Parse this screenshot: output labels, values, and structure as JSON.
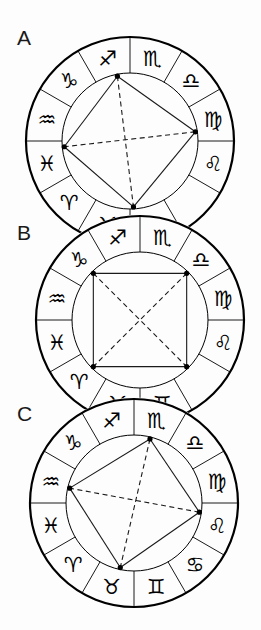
{
  "figure": {
    "type": "astrological-aspect-pattern-diagram",
    "panel_count": 3,
    "canvas": {
      "width": 261,
      "height": 630
    },
    "background_color": "#fdfdfd",
    "stroke_color": "#000000",
    "line_color": "#1a1a1a"
  },
  "zodiac": {
    "order_counterclockwise_from_top_right": [
      "Sagittarius",
      "Capricorn",
      "Aquarius",
      "Pisces",
      "Aries",
      "Taurus",
      "Gemini",
      "Cancer",
      "Leo",
      "Virgo",
      "Libra",
      "Scorpio"
    ],
    "glyphs": {
      "Aries": "♈",
      "Taurus": "♉",
      "Gemini": "♊",
      "Cancer": "♋",
      "Leo": "♌",
      "Virgo": "♍",
      "Libra": "♎",
      "Scorpio": "♏",
      "Sagittarius": "♐",
      "Capricorn": "♑",
      "Aquarius": "♒",
      "Pisces": "♓"
    },
    "sector_count": 12,
    "sector_span_degrees": 30
  },
  "panels": [
    {
      "id": "A",
      "label": "A",
      "label_position": {
        "x": 17,
        "y": 27
      },
      "center": {
        "x": 130,
        "y": 141
      },
      "outer_radius": 104,
      "inner_radius": 68,
      "visible_signs": [
        "Sagittarius",
        "Capricorn",
        "Aquarius",
        "Pisces",
        "Aries",
        "Taurus",
        "Leo",
        "Virgo",
        "Libra",
        "Scorpio"
      ],
      "clipped_bottom": true,
      "aspect_figure": {
        "shape": "kite-quadrilateral",
        "vertex_count": 4,
        "vertices": [
          {
            "name": "point-top",
            "angle_deg": 101,
            "sign": "Capricorn"
          },
          {
            "name": "point-right",
            "angle_deg": 8,
            "sign": "Libra"
          },
          {
            "name": "point-bottom",
            "angle_deg": 273,
            "sign": "Cancer"
          },
          {
            "name": "point-left",
            "angle_deg": 185,
            "sign": "Aries"
          }
        ],
        "solid_edges": [
          [
            0,
            1
          ],
          [
            1,
            2
          ],
          [
            2,
            3
          ],
          [
            3,
            0
          ]
        ],
        "dashed_edges": [
          [
            0,
            2
          ],
          [
            1,
            3
          ]
        ]
      }
    },
    {
      "id": "B",
      "label": "B",
      "label_position": {
        "x": 17,
        "y": 222
      },
      "center": {
        "x": 140,
        "y": 320
      },
      "outer_radius": 104,
      "inner_radius": 68,
      "visible_signs": [
        "Sagittarius",
        "Capricorn",
        "Aquarius",
        "Pisces",
        "Aries",
        "Taurus",
        "Gemini",
        "Leo",
        "Virgo",
        "Libra",
        "Scorpio"
      ],
      "clipped_bottom": true,
      "aspect_figure": {
        "shape": "grand-square",
        "vertex_count": 4,
        "vertices": [
          {
            "name": "point-top-left",
            "angle_deg": 135,
            "sign": "Aquarius"
          },
          {
            "name": "point-top-right",
            "angle_deg": 45,
            "sign": "Scorpio"
          },
          {
            "name": "point-bottom-right",
            "angle_deg": 315,
            "sign": "Leo"
          },
          {
            "name": "point-bottom-left",
            "angle_deg": 225,
            "sign": "Taurus"
          }
        ],
        "solid_edges": [
          [
            0,
            1
          ],
          [
            1,
            2
          ],
          [
            2,
            3
          ],
          [
            3,
            0
          ]
        ],
        "dashed_edges": [
          [
            0,
            2
          ],
          [
            1,
            3
          ]
        ]
      }
    },
    {
      "id": "C",
      "label": "C",
      "label_position": {
        "x": 17,
        "y": 403
      },
      "center": {
        "x": 134,
        "y": 503
      },
      "outer_radius": 104,
      "inner_radius": 68,
      "visible_signs": [
        "Sagittarius",
        "Capricorn",
        "Aquarius",
        "Pisces",
        "Aries",
        "Taurus",
        "Gemini",
        "Cancer",
        "Leo",
        "Virgo",
        "Libra",
        "Scorpio"
      ],
      "clipped_bottom": false,
      "aspect_figure": {
        "shape": "irregular-quadrilateral",
        "vertex_count": 4,
        "vertices": [
          {
            "name": "point-top",
            "angle_deg": 76,
            "sign": "Sagittarius"
          },
          {
            "name": "point-right",
            "angle_deg": 352,
            "sign": "Virgo"
          },
          {
            "name": "point-bottom",
            "angle_deg": 258,
            "sign": "Gemini"
          },
          {
            "name": "point-left",
            "angle_deg": 167,
            "sign": "Pisces"
          }
        ],
        "solid_edges": [
          [
            0,
            1
          ],
          [
            1,
            2
          ],
          [
            2,
            3
          ],
          [
            3,
            0
          ]
        ],
        "dashed_edges": [
          [
            0,
            2
          ],
          [
            1,
            3
          ]
        ]
      }
    }
  ],
  "style": {
    "outer_ring_stroke_width": 2.2,
    "inner_circle_stroke_width": 1.0,
    "spoke_stroke_width": 0.9,
    "aspect_solid_stroke_width": 1.1,
    "aspect_dashed_stroke_width": 1.1,
    "dash_pattern": "5,3.5",
    "vertex_dot_radius": 2.6,
    "glyph_font_size": 21
  }
}
